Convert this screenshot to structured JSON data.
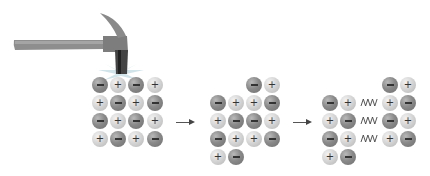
{
  "figure": {
    "colors": {
      "negative_ion": "#7a7a7a",
      "positive_ion": "#d6d6d6",
      "hammer_handle": "#8c8c8c",
      "impact_burst": "#c8dfe6"
    },
    "stages": [
      {
        "name": "intact-crystal",
        "ions": [
          {
            "x": 100,
            "y": 85,
            "charge": "-"
          },
          {
            "x": 118,
            "y": 85,
            "charge": "+"
          },
          {
            "x": 136,
            "y": 85,
            "charge": "-"
          },
          {
            "x": 155,
            "y": 85,
            "charge": "+"
          },
          {
            "x": 100,
            "y": 103,
            "charge": "+"
          },
          {
            "x": 118,
            "y": 103,
            "charge": "-"
          },
          {
            "x": 136,
            "y": 103,
            "charge": "+"
          },
          {
            "x": 155,
            "y": 103,
            "charge": "-"
          },
          {
            "x": 100,
            "y": 121,
            "charge": "-"
          },
          {
            "x": 118,
            "y": 121,
            "charge": "+"
          },
          {
            "x": 136,
            "y": 121,
            "charge": "-"
          },
          {
            "x": 155,
            "y": 121,
            "charge": "+"
          },
          {
            "x": 100,
            "y": 139,
            "charge": "+"
          },
          {
            "x": 118,
            "y": 139,
            "charge": "-"
          },
          {
            "x": 136,
            "y": 139,
            "charge": "+"
          },
          {
            "x": 155,
            "y": 139,
            "charge": "-"
          }
        ]
      },
      {
        "name": "shifted-layer",
        "ions": [
          {
            "x": 254,
            "y": 85,
            "charge": "-"
          },
          {
            "x": 272,
            "y": 85,
            "charge": "+"
          },
          {
            "x": 218,
            "y": 103,
            "charge": "-"
          },
          {
            "x": 236,
            "y": 103,
            "charge": "+"
          },
          {
            "x": 254,
            "y": 103,
            "charge": "+"
          },
          {
            "x": 272,
            "y": 103,
            "charge": "-"
          },
          {
            "x": 218,
            "y": 121,
            "charge": "+"
          },
          {
            "x": 236,
            "y": 121,
            "charge": "-"
          },
          {
            "x": 254,
            "y": 121,
            "charge": "-"
          },
          {
            "x": 272,
            "y": 121,
            "charge": "+"
          },
          {
            "x": 218,
            "y": 139,
            "charge": "-"
          },
          {
            "x": 236,
            "y": 139,
            "charge": "+"
          },
          {
            "x": 254,
            "y": 139,
            "charge": "+"
          },
          {
            "x": 272,
            "y": 139,
            "charge": "-"
          },
          {
            "x": 218,
            "y": 157,
            "charge": "+"
          },
          {
            "x": 236,
            "y": 157,
            "charge": "-"
          }
        ]
      },
      {
        "name": "shattered-crystal",
        "ions": [
          {
            "x": 390,
            "y": 85,
            "charge": "-"
          },
          {
            "x": 408,
            "y": 85,
            "charge": "+"
          },
          {
            "x": 330,
            "y": 103,
            "charge": "-"
          },
          {
            "x": 348,
            "y": 103,
            "charge": "+"
          },
          {
            "x": 390,
            "y": 103,
            "charge": "+"
          },
          {
            "x": 408,
            "y": 103,
            "charge": "-"
          },
          {
            "x": 330,
            "y": 121,
            "charge": "+"
          },
          {
            "x": 348,
            "y": 121,
            "charge": "-"
          },
          {
            "x": 390,
            "y": 121,
            "charge": "-"
          },
          {
            "x": 408,
            "y": 121,
            "charge": "+"
          },
          {
            "x": 330,
            "y": 139,
            "charge": "-"
          },
          {
            "x": 348,
            "y": 139,
            "charge": "+"
          },
          {
            "x": 390,
            "y": 139,
            "charge": "+"
          },
          {
            "x": 408,
            "y": 139,
            "charge": "-"
          },
          {
            "x": 330,
            "y": 157,
            "charge": "+"
          },
          {
            "x": 348,
            "y": 157,
            "charge": "-"
          }
        ],
        "repulsion_marks": [
          {
            "x": 369,
            "y": 103
          },
          {
            "x": 369,
            "y": 121
          },
          {
            "x": 369,
            "y": 139
          }
        ]
      }
    ],
    "arrows": [
      {
        "x1": 176,
        "x2": 193,
        "y": 122
      },
      {
        "x1": 293,
        "x2": 310,
        "y": 122
      }
    ]
  }
}
